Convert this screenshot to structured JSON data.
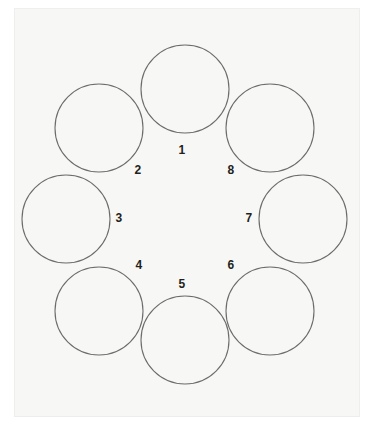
{
  "figure": {
    "background_color": "#f7f7f6",
    "page_background": "#ffffff",
    "stroke_color": "#6c6c6c",
    "label_color": "#231f20",
    "panel": {
      "x": 14,
      "y": 8,
      "width": 346,
      "height": 409
    }
  },
  "chart_data": {
    "type": "diagram",
    "layout": "radial-ring",
    "node_count": 8,
    "nodes": [
      {
        "label": "1",
        "cx": 185,
        "cy": 89,
        "r": 44,
        "label_x": 182,
        "label_y": 150
      },
      {
        "label": "2",
        "cx": 99,
        "cy": 128,
        "r": 44,
        "label_x": 138,
        "label_y": 170
      },
      {
        "label": "3",
        "cx": 66,
        "cy": 219,
        "r": 44,
        "label_x": 119,
        "label_y": 218
      },
      {
        "label": "4",
        "cx": 99,
        "cy": 311,
        "r": 44,
        "label_x": 139,
        "label_y": 265
      },
      {
        "label": "5",
        "cx": 185,
        "cy": 340,
        "r": 44,
        "label_x": 182,
        "label_y": 284
      },
      {
        "label": "6",
        "cx": 270,
        "cy": 311,
        "r": 44,
        "label_x": 231,
        "label_y": 265
      },
      {
        "label": "7",
        "cx": 303,
        "cy": 219,
        "r": 44,
        "label_x": 249,
        "label_y": 218
      },
      {
        "label": "8",
        "cx": 270,
        "cy": 128,
        "r": 44,
        "label_x": 231,
        "label_y": 170
      }
    ],
    "title": "",
    "xlabel": "",
    "ylabel": ""
  }
}
